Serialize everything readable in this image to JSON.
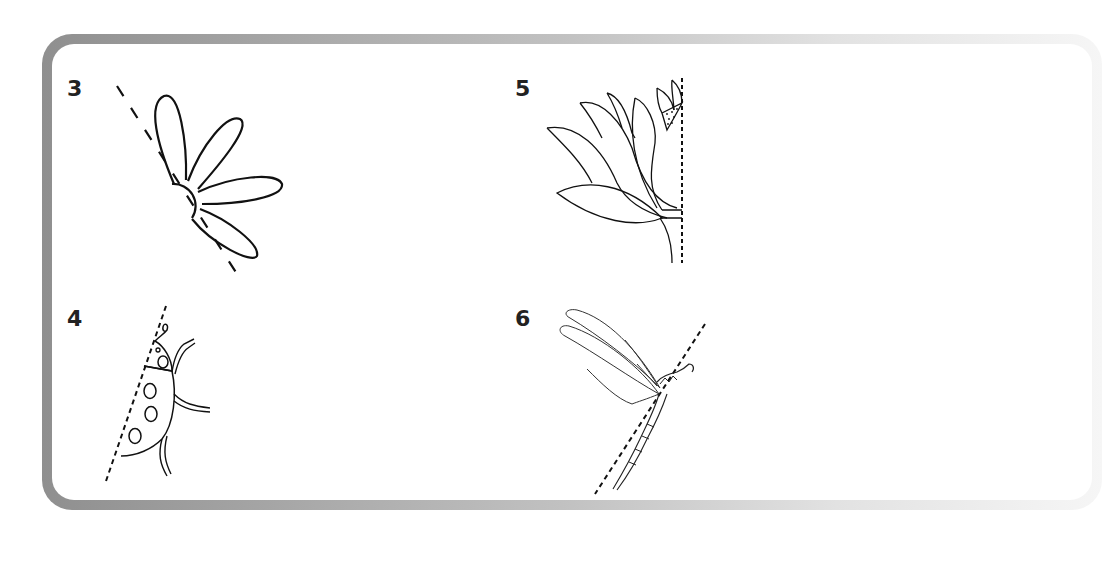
{
  "worksheet": {
    "exercises": [
      {
        "number": "3",
        "subject": "flower-petals",
        "mirror_line": "diagonal dashed line"
      },
      {
        "number": "4",
        "subject": "ladybug",
        "mirror_line": "diagonal dotted line"
      },
      {
        "number": "5",
        "subject": "lotus-flower",
        "mirror_line": "vertical dotted line"
      },
      {
        "number": "6",
        "subject": "dragonfly",
        "mirror_line": "diagonal dotted line"
      }
    ]
  },
  "colors": {
    "frame_dark": "#8f8f8f",
    "frame_light": "#f6f6f6",
    "ink": "#111111",
    "number": "#222222"
  }
}
